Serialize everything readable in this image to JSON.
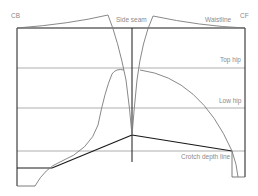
{
  "diagram": {
    "labels": {
      "cb": "CB",
      "cf": "CF",
      "side_seam": "Side seam",
      "waistline": "Waistline",
      "top_hip": "Top hip",
      "low_hip": "Low hip",
      "crotch_depth_line": "Crotch depth line"
    },
    "colors": {
      "frame": "#1a1a1a",
      "guide": "#8c8c8c",
      "curve": "#7a7a7a",
      "label": "#8a8a8a",
      "background": "#ffffff"
    }
  }
}
